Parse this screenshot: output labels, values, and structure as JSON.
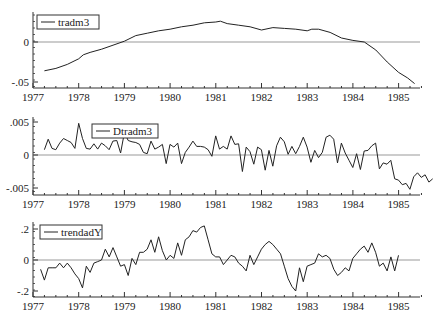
{
  "chart_data": [
    {
      "type": "line",
      "title": "",
      "legend": [
        "tradm3"
      ],
      "xlabel": "",
      "ylabel": "",
      "xlim": [
        1977,
        1985.5
      ],
      "ylim": [
        -0.057,
        0.025
      ],
      "yticks": [
        ".05",
        "0",
        "-.05"
      ],
      "ytick_labels": [
        "0",
        "-.05"
      ],
      "xtick_labels": [
        "1977",
        "1978",
        "1979",
        "1980",
        "1981",
        "1982",
        "1983",
        "1984",
        "1985"
      ],
      "reference_line": 0,
      "series": [
        {
          "name": "tradm3",
          "x": [
            1977.25,
            1977.5,
            1977.75,
            1978.0,
            1978.1,
            1978.25,
            1978.5,
            1978.75,
            1979.0,
            1979.25,
            1979.5,
            1979.75,
            1980.0,
            1980.25,
            1980.5,
            1980.75,
            1981.0,
            1981.1,
            1981.25,
            1981.5,
            1981.75,
            1982.0,
            1982.25,
            1982.5,
            1982.75,
            1983.0,
            1983.1,
            1983.25,
            1983.5,
            1983.75,
            1984.0,
            1984.25,
            1984.5,
            1984.75,
            1985.0,
            1985.2,
            1985.35
          ],
          "values": [
            -0.036,
            -0.033,
            -0.028,
            -0.021,
            -0.016,
            -0.013,
            -0.009,
            -0.004,
            0.001,
            0.008,
            0.011,
            0.014,
            0.016,
            0.019,
            0.021,
            0.024,
            0.025,
            0.026,
            0.023,
            0.021,
            0.019,
            0.015,
            0.018,
            0.017,
            0.016,
            0.014,
            0.016,
            0.016,
            0.012,
            0.005,
            0.002,
            0.0,
            -0.01,
            -0.025,
            -0.038,
            -0.045,
            -0.052
          ]
        }
      ]
    },
    {
      "type": "line",
      "legend": [
        "Dtradm3"
      ],
      "xlim": [
        1977,
        1985.5
      ],
      "ylim": [
        -0.0055,
        0.005
      ],
      "ytick_labels": [
        ".005",
        "0",
        "-.005"
      ],
      "xtick_labels": [
        "1977",
        "1978",
        "1979",
        "1980",
        "1981",
        "1982",
        "1983",
        "1984",
        "1985"
      ],
      "reference_line": 0,
      "series": [
        {
          "name": "Dtradm3",
          "x_start": 1977.25,
          "x_step": 0.0833,
          "values": [
            0.0008,
            0.0024,
            0.001,
            0.0008,
            0.0018,
            0.0025,
            0.0022,
            0.0019,
            0.001,
            0.0048,
            0.0025,
            0.001,
            0.0009,
            0.0017,
            0.0009,
            0.0018,
            0.0014,
            0.0008,
            0.0021,
            0.0022,
            0.0003,
            0.0034,
            0.0022,
            0.002,
            0.0019,
            0.0016,
            0.0004,
            0.0002,
            0.0021,
            0.0009,
            0.0012,
            0.0016,
            -0.0013,
            0.0016,
            0.0012,
            0.0018,
            -0.0013,
            0.0004,
            0.0012,
            0.0021,
            0.0013,
            0.0013,
            0.0012,
            0.0008,
            -0.0002,
            0.0029,
            0.0009,
            0.0013,
            0.0009,
            0.0029,
            0.0016,
            0.0017,
            -0.0025,
            0.0012,
            0.0005,
            -0.0014,
            0.0012,
            0.0008,
            -0.0023,
            0.0007,
            -0.0017,
            0.0014,
            0.0027,
            0.002,
            0.0001,
            0.0013,
            0.0002,
            0.0013,
            0.0027,
            0.0012,
            -0.0011,
            0.0007,
            -0.0004,
            0.0004,
            0.0027,
            0.003,
            0.0024,
            -0.0012,
            0.0018,
            0.0003,
            -0.0008,
            -0.0019,
            0.0002,
            -0.0022,
            0.0006,
            0.0007,
            0.0014,
            0.0018,
            -0.0021,
            -0.0012,
            -0.0014,
            -0.0008,
            -0.0036,
            -0.0038,
            -0.0045,
            -0.0043,
            -0.0052,
            -0.0033,
            -0.0027,
            -0.0034,
            -0.003,
            -0.0041,
            -0.0036
          ]
        }
      ]
    },
    {
      "type": "line",
      "legend": [
        "trendadY"
      ],
      "xlim": [
        1977,
        1985.5
      ],
      "ylim": [
        -0.22,
        0.25
      ],
      "ytick_labels": [
        ".2",
        "0",
        "-.2"
      ],
      "xtick_labels": [
        "1977",
        "1978",
        "1979",
        "1980",
        "1981",
        "1982",
        "1983",
        "1984",
        "1985"
      ],
      "reference_line": 0,
      "series": [
        {
          "name": "trendadY",
          "x_start": 1977.167,
          "x_step": 0.0833,
          "values": [
            -0.06,
            -0.13,
            -0.05,
            -0.05,
            -0.05,
            -0.02,
            -0.05,
            -0.02,
            -0.05,
            -0.09,
            -0.12,
            -0.18,
            -0.04,
            -0.08,
            -0.02,
            -0.01,
            0.0,
            0.07,
            0.02,
            0.08,
            0.02,
            -0.04,
            -0.03,
            -0.1,
            0.01,
            -0.03,
            0.05,
            0.05,
            0.07,
            0.13,
            0.05,
            0.15,
            0.06,
            0.0,
            0.03,
            0.01,
            0.11,
            0.03,
            0.13,
            0.15,
            0.19,
            0.18,
            0.21,
            0.22,
            0.13,
            0.04,
            0.02,
            0.02,
            -0.03,
            0.0,
            0.03,
            0.02,
            -0.02,
            -0.04,
            -0.07,
            0.03,
            -0.03,
            0.02,
            0.07,
            0.1,
            0.12,
            0.1,
            0.07,
            0.04,
            -0.04,
            -0.12,
            -0.17,
            -0.2,
            -0.05,
            -0.14,
            -0.04,
            -0.03,
            -0.02,
            0.04,
            0.02,
            0.03,
            0.01,
            -0.06,
            -0.1,
            -0.08,
            -0.05,
            -0.07,
            0.01,
            0.04,
            0.07,
            0.09,
            0.05,
            0.11,
            0.05,
            -0.04,
            -0.02,
            -0.07,
            0.02,
            -0.07,
            0.03
          ]
        }
      ]
    }
  ]
}
